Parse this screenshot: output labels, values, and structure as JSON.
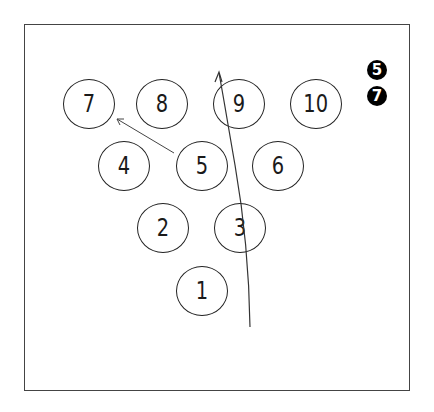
{
  "diagram": {
    "type": "bowling-pin-layout",
    "pins": [
      {
        "label": "7",
        "x": 63,
        "y": 79
      },
      {
        "label": "8",
        "x": 136,
        "y": 79
      },
      {
        "label": "9",
        "x": 213,
        "y": 79
      },
      {
        "label": "10",
        "x": 290,
        "y": 79
      },
      {
        "label": "4",
        "x": 98,
        "y": 141
      },
      {
        "label": "5",
        "x": 176,
        "y": 141
      },
      {
        "label": "6",
        "x": 252,
        "y": 141
      },
      {
        "label": "2",
        "x": 137,
        "y": 203
      },
      {
        "label": "3",
        "x": 214,
        "y": 203
      },
      {
        "label": "1",
        "x": 176,
        "y": 266
      }
    ],
    "badges": [
      {
        "label": "5",
        "x": 367,
        "y": 60
      },
      {
        "label": "7",
        "x": 367,
        "y": 86
      }
    ],
    "arrows": [
      {
        "name": "ball-path-arrow",
        "from": "below pin 1 (right side)",
        "to": "through pin 3 and pin 9, past top"
      },
      {
        "name": "deflection-arrow",
        "from": "pin 5",
        "to": "pin 7"
      }
    ],
    "colors": {
      "stroke": "#222222",
      "badge_fill": "#000000",
      "badge_text": "#ffffff",
      "background": "#ffffff"
    }
  }
}
